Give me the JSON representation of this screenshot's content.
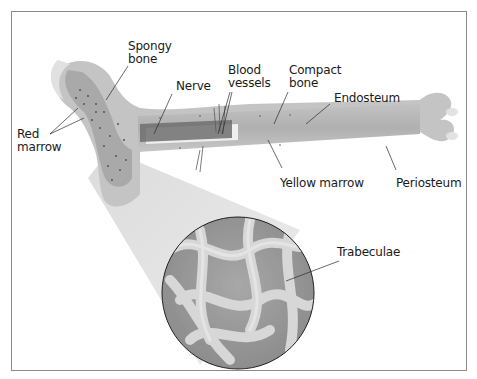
{
  "diagram": {
    "labels": {
      "spongy_bone": "Spongy\nbone",
      "red_marrow": "Red\nmarrow",
      "nerve": "Nerve",
      "blood_vessels": "Blood\nvessels",
      "compact_bone": "Compact\nbone",
      "endosteum": "Endosteum",
      "yellow_marrow": "Yellow marrow",
      "periosteum": "Periosteum",
      "trabeculae": "Trabeculae"
    },
    "colors": {
      "bone_outer": "#c9c9c9",
      "bone_shaft": "#b4b4b4",
      "marrow_cavity": "#efefef",
      "nerve": "#6d6d6d",
      "frame_border": "#8a8a8a",
      "magnifier_cone": "#dcdcdc",
      "trabeculae_light": "#d6d6d6",
      "trabeculae_dark": "#7e7e7e"
    }
  }
}
